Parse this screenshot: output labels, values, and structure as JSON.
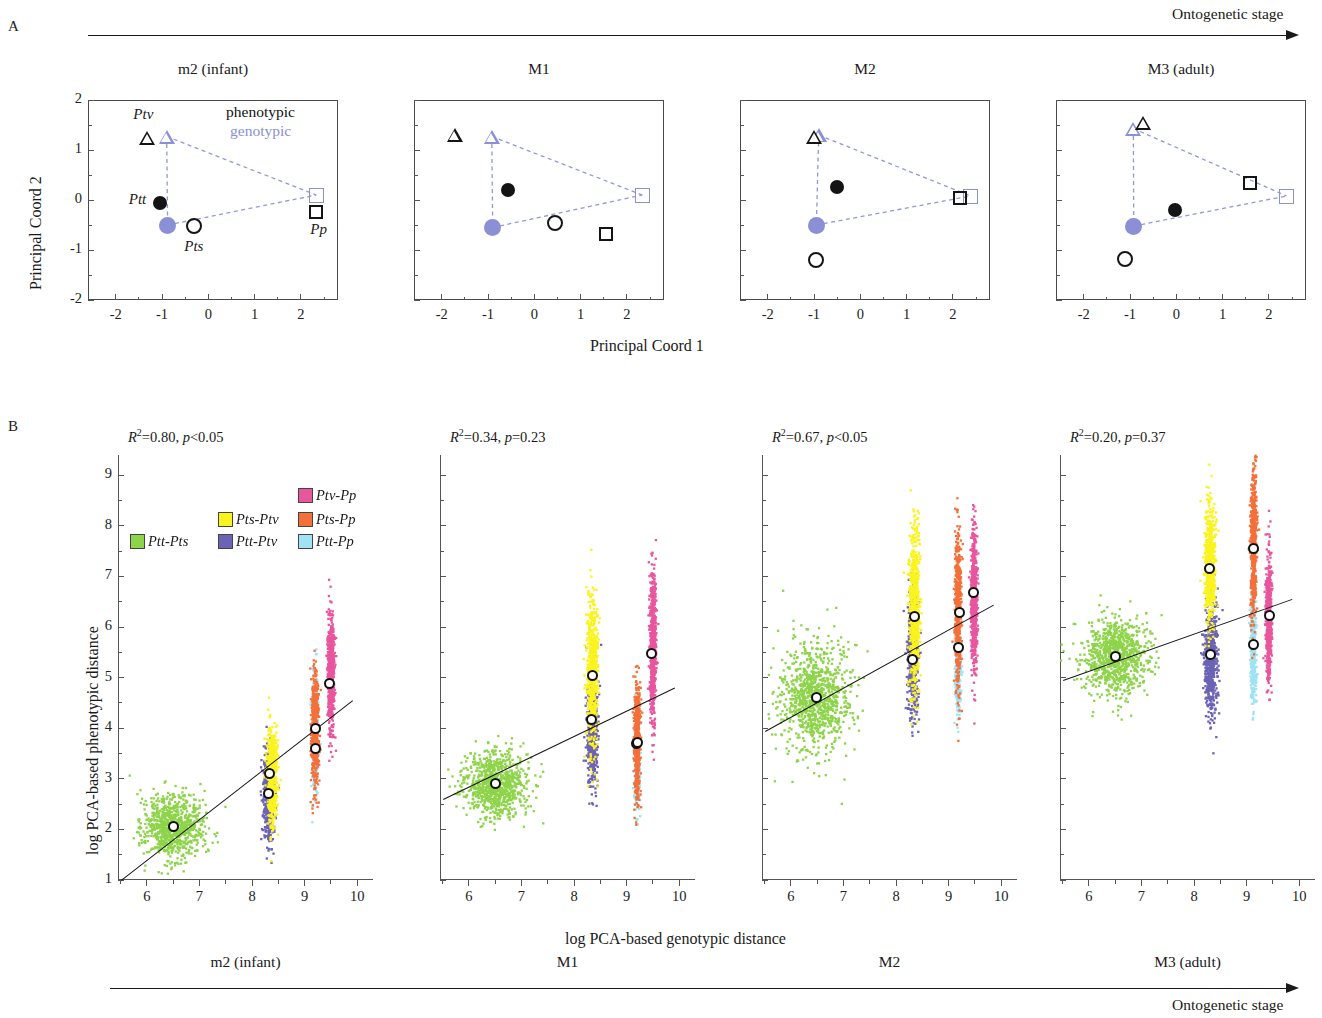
{
  "figure": {
    "panel_a_letter": "A",
    "panel_b_letter": "B",
    "top_arrow_label": "Ontogenetic stage",
    "bottom_arrow_label": "Ontogenetic stage"
  },
  "stages": [
    "m2 (infant)",
    "M1",
    "M2",
    "M3 (adult)"
  ],
  "panelA": {
    "xlabel": "Principal Coord 1",
    "ylabel": "Principal Coord 2",
    "xticks": [
      "-2",
      "-1",
      "0",
      "1",
      "2"
    ],
    "yticks": [
      "2",
      "1",
      "0",
      "-1",
      "-2"
    ],
    "xlim": [
      -2.6,
      2.8
    ],
    "ylim": [
      -2.0,
      2.0
    ],
    "legend": {
      "phenotypic": "phenotypic",
      "genotypic": "genotypic"
    },
    "colors": {
      "phenotypic": "#141414",
      "genotypic": "#8a8fd6"
    },
    "taxon_labels": [
      {
        "text": "Ptv",
        "panel": 0,
        "x": -1.62,
        "y": 1.68
      },
      {
        "text": "Ptt",
        "panel": 0,
        "x": -1.72,
        "y": -0.02
      },
      {
        "text": "Pts",
        "panel": 0,
        "x": -0.52,
        "y": -0.95
      },
      {
        "text": "Pp",
        "panel": 0,
        "x": 2.2,
        "y": -0.62
      }
    ],
    "panels": [
      {
        "stage": "m2 (infant)",
        "phenotypic": [
          {
            "taxon": "Ptv",
            "marker": "triangle",
            "x": -1.32,
            "y": 1.25
          },
          {
            "taxon": "Ptt",
            "marker": "circle-filled",
            "x": -1.05,
            "y": -0.05
          },
          {
            "taxon": "Pts",
            "marker": "circle-open",
            "x": -0.32,
            "y": -0.52
          },
          {
            "taxon": "Pp",
            "marker": "square-open",
            "x": 2.33,
            "y": -0.23
          }
        ],
        "genotypic": [
          {
            "taxon": "Ptv",
            "marker": "triangle",
            "x": -0.9,
            "y": 1.27
          },
          {
            "taxon": "Pts",
            "marker": "circle-filled",
            "x": -0.88,
            "y": -0.5
          },
          {
            "taxon": "Pp",
            "marker": "square-open",
            "x": 2.33,
            "y": 0.1
          }
        ]
      },
      {
        "stage": "M1",
        "phenotypic": [
          {
            "taxon": "Ptv",
            "marker": "triangle",
            "x": -1.72,
            "y": 1.3
          },
          {
            "taxon": "Ptt",
            "marker": "circle-filled",
            "x": -0.58,
            "y": 0.2
          },
          {
            "taxon": "Pts",
            "marker": "circle-open",
            "x": 0.45,
            "y": -0.45
          },
          {
            "taxon": "Pp",
            "marker": "square-open",
            "x": 1.55,
            "y": -0.68
          }
        ],
        "genotypic": [
          {
            "taxon": "Ptv",
            "marker": "triangle",
            "x": -0.92,
            "y": 1.27
          },
          {
            "taxon": "Pts",
            "marker": "circle-filled",
            "x": -0.9,
            "y": -0.55
          },
          {
            "taxon": "Pp",
            "marker": "square-open",
            "x": 2.33,
            "y": 0.1
          }
        ]
      },
      {
        "stage": "M2",
        "phenotypic": [
          {
            "taxon": "Ptv",
            "marker": "triangle",
            "x": -1.0,
            "y": 1.26
          },
          {
            "taxon": "Ptt",
            "marker": "circle-filled",
            "x": -0.5,
            "y": 0.27
          },
          {
            "taxon": "Pts",
            "marker": "circle-open",
            "x": -0.95,
            "y": -1.2
          },
          {
            "taxon": "Pp",
            "marker": "square-open",
            "x": 2.15,
            "y": 0.05
          }
        ],
        "genotypic": [
          {
            "taxon": "Ptv",
            "marker": "triangle",
            "x": -0.9,
            "y": 1.3
          },
          {
            "taxon": "Pts",
            "marker": "circle-filled",
            "x": -0.95,
            "y": -0.5
          },
          {
            "taxon": "Pp",
            "marker": "square-open",
            "x": 2.38,
            "y": 0.08
          }
        ]
      },
      {
        "stage": "M3 (adult)",
        "phenotypic": [
          {
            "taxon": "Ptv",
            "marker": "triangle",
            "x": -0.72,
            "y": 1.55
          },
          {
            "taxon": "Ptt",
            "marker": "circle-filled",
            "x": -0.03,
            "y": -0.2
          },
          {
            "taxon": "Pts",
            "marker": "circle-open",
            "x": -1.12,
            "y": -1.18
          },
          {
            "taxon": "Pp",
            "marker": "square-open",
            "x": 1.6,
            "y": 0.35
          }
        ],
        "genotypic": [
          {
            "taxon": "Ptv",
            "marker": "triangle",
            "x": -0.93,
            "y": 1.43
          },
          {
            "taxon": "Pts",
            "marker": "circle-filled",
            "x": -0.92,
            "y": -0.52
          },
          {
            "taxon": "Pp",
            "marker": "square-open",
            "x": 2.38,
            "y": 0.08
          }
        ]
      }
    ]
  },
  "panelB": {
    "xlabel": "log PCA-based genotypic distance",
    "ylabel": "log PCA-based phenotypic distance",
    "xticks": [
      "6",
      "7",
      "8",
      "9",
      "10"
    ],
    "yticks": [
      "9",
      "8",
      "7",
      "6",
      "5",
      "4",
      "3",
      "2",
      "1"
    ],
    "xlim": [
      5.45,
      10.3
    ],
    "ylim": [
      1.0,
      9.4
    ],
    "legend": [
      {
        "label": "Ptt-Pts",
        "color": "#8ed44a"
      },
      {
        "label": "Pts-Ptv",
        "color": "#fbf31f"
      },
      {
        "label": "Ptv-Pp",
        "color": "#e8569e"
      },
      {
        "label": "Ptt-Ptv",
        "color": "#6b63b5"
      },
      {
        "label": "Pts-Pp",
        "color": "#f4703a"
      },
      {
        "label": "Ptt-Pp",
        "color": "#9fe3f5"
      }
    ],
    "panels": [
      {
        "stage": "m2 (infant)",
        "stat_r2": "0.80",
        "stat_p": "p<0.05",
        "stat_text": "R2=0.80, p<0.05",
        "fit": {
          "x0": 5.5,
          "y0": 1.0,
          "x1": 9.9,
          "y1": 4.55
        },
        "clouds": [
          {
            "label": "Ptt-Pts",
            "color": "#8ed44a",
            "cx": 6.5,
            "cy": 2.05,
            "sx": 0.28,
            "sy": 0.32,
            "n": 900,
            "mean_x": 6.5,
            "mean_y": 2.05
          },
          {
            "label": "Ptt-Ptv",
            "color": "#6b63b5",
            "cx": 8.32,
            "cy": 2.7,
            "sx": 0.055,
            "sy": 0.45,
            "n": 500,
            "mean_x": 8.32,
            "mean_y": 2.7
          },
          {
            "label": "Pts-Ptv",
            "color": "#fbf31f",
            "cx": 8.38,
            "cy": 3.1,
            "sx": 0.05,
            "sy": 0.48,
            "n": 620,
            "mean_x": 8.34,
            "mean_y": 3.1
          },
          {
            "label": "Ptt-Pp",
            "color": "#9fe3f5",
            "cx": 9.2,
            "cy": 3.85,
            "sx": 0.035,
            "sy": 0.55,
            "n": 320,
            "mean_x": 9.2,
            "mean_y": 3.6
          },
          {
            "label": "Pts-Pp",
            "color": "#f4703a",
            "cx": 9.2,
            "cy": 3.95,
            "sx": 0.035,
            "sy": 0.6,
            "n": 520,
            "mean_x": 9.2,
            "mean_y": 4.0
          },
          {
            "label": "Ptv-Pp",
            "color": "#e8569e",
            "cx": 9.5,
            "cy": 5.1,
            "sx": 0.035,
            "sy": 0.55,
            "n": 620,
            "mean_x": 9.48,
            "mean_y": 4.88
          }
        ]
      },
      {
        "stage": "M1",
        "stat_r2": "0.34",
        "stat_p": "p=0.23",
        "stat_text": "R2=0.34, p=0.23",
        "fit": {
          "x0": 5.5,
          "y0": 2.6,
          "x1": 9.9,
          "y1": 4.8
        },
        "clouds": [
          {
            "label": "Ptt-Pts",
            "color": "#8ed44a",
            "cx": 6.5,
            "cy": 2.9,
            "sx": 0.3,
            "sy": 0.33,
            "n": 900,
            "mean_x": 6.5,
            "mean_y": 2.9
          },
          {
            "label": "Ptt-Ptv",
            "color": "#6b63b5",
            "cx": 8.35,
            "cy": 3.95,
            "sx": 0.05,
            "sy": 0.55,
            "n": 520,
            "mean_x": 8.33,
            "mean_y": 4.17
          },
          {
            "label": "Pts-Ptv",
            "color": "#fbf31f",
            "cx": 8.35,
            "cy": 5.1,
            "sx": 0.05,
            "sy": 0.75,
            "n": 680,
            "mean_x": 8.35,
            "mean_y": 5.05
          },
          {
            "label": "Ptt-Pp",
            "color": "#9fe3f5",
            "cx": 9.2,
            "cy": 3.3,
            "sx": 0.03,
            "sy": 0.5,
            "n": 260,
            "mean_x": 9.18,
            "mean_y": 3.7
          },
          {
            "label": "Pts-Pp",
            "color": "#f4703a",
            "cx": 9.2,
            "cy": 3.75,
            "sx": 0.03,
            "sy": 0.6,
            "n": 520,
            "mean_x": 9.2,
            "mean_y": 3.72
          },
          {
            "label": "Ptv-Pp",
            "color": "#e8569e",
            "cx": 9.5,
            "cy": 5.6,
            "sx": 0.03,
            "sy": 0.72,
            "n": 620,
            "mean_x": 9.48,
            "mean_y": 5.48
          }
        ]
      },
      {
        "stage": "M2",
        "stat_r2": "0.67",
        "stat_p": "p<0.05",
        "stat_text": "R2=0.67, p<0.05",
        "fit": {
          "x0": 5.5,
          "y0": 3.95,
          "x1": 9.85,
          "y1": 6.45
        },
        "clouds": [
          {
            "label": "Ptt-Pts",
            "color": "#8ed44a",
            "cx": 6.45,
            "cy": 4.6,
            "sx": 0.33,
            "sy": 0.55,
            "n": 1000,
            "mean_x": 6.48,
            "mean_y": 4.6
          },
          {
            "label": "Ptt-Ptv",
            "color": "#6b63b5",
            "cx": 8.32,
            "cy": 5.4,
            "sx": 0.05,
            "sy": 0.6,
            "n": 540,
            "mean_x": 8.32,
            "mean_y": 5.35
          },
          {
            "label": "Pts-Ptv",
            "color": "#fbf31f",
            "cx": 8.35,
            "cy": 6.35,
            "sx": 0.05,
            "sy": 0.78,
            "n": 700,
            "mean_x": 8.35,
            "mean_y": 6.2
          },
          {
            "label": "Ptt-Pp",
            "color": "#9fe3f5",
            "cx": 9.18,
            "cy": 5.1,
            "sx": 0.03,
            "sy": 0.4,
            "n": 240,
            "mean_x": 9.18,
            "mean_y": 5.6
          },
          {
            "label": "Pts-Pp",
            "color": "#f4703a",
            "cx": 9.18,
            "cy": 6.3,
            "sx": 0.03,
            "sy": 0.8,
            "n": 560,
            "mean_x": 9.2,
            "mean_y": 6.28
          },
          {
            "label": "Ptv-Pp",
            "color": "#e8569e",
            "cx": 9.48,
            "cy": 6.55,
            "sx": 0.03,
            "sy": 0.72,
            "n": 620,
            "mean_x": 9.48,
            "mean_y": 6.68
          }
        ]
      },
      {
        "stage": "M3 (adult)",
        "stat_r2": "0.20",
        "stat_p": "p=0.37",
        "stat_text": "R2=0.20, p=0.37",
        "fit": {
          "x0": 5.5,
          "y0": 4.95,
          "x1": 9.85,
          "y1": 6.55
        },
        "clouds": [
          {
            "label": "Ptt-Pts",
            "color": "#8ed44a",
            "cx": 6.5,
            "cy": 5.4,
            "sx": 0.3,
            "sy": 0.38,
            "n": 950,
            "mean_x": 6.5,
            "mean_y": 5.42
          },
          {
            "label": "Ptt-Ptv",
            "color": "#6b63b5",
            "cx": 8.32,
            "cy": 5.35,
            "sx": 0.06,
            "sy": 0.55,
            "n": 660,
            "mean_x": 8.32,
            "mean_y": 5.45
          },
          {
            "label": "Pts-Ptv",
            "color": "#fbf31f",
            "cx": 8.3,
            "cy": 7.2,
            "sx": 0.05,
            "sy": 0.6,
            "n": 600,
            "mean_x": 8.3,
            "mean_y": 7.15
          },
          {
            "label": "Ptt-Pp",
            "color": "#9fe3f5",
            "cx": 9.13,
            "cy": 5.5,
            "sx": 0.028,
            "sy": 0.55,
            "n": 380,
            "mean_x": 9.13,
            "mean_y": 5.65
          },
          {
            "label": "Pts-Pp",
            "color": "#f4703a",
            "cx": 9.13,
            "cy": 7.6,
            "sx": 0.028,
            "sy": 0.75,
            "n": 560,
            "mean_x": 9.13,
            "mean_y": 7.55
          },
          {
            "label": "Ptv-Pp",
            "color": "#e8569e",
            "cx": 9.42,
            "cy": 6.2,
            "sx": 0.028,
            "sy": 0.6,
            "n": 560,
            "mean_x": 9.44,
            "mean_y": 6.22
          }
        ]
      }
    ]
  },
  "chart_data": {
    "type": "scatter",
    "title": "",
    "panels_row_a": {
      "type": "scatter",
      "xlabel": "Principal Coord 1",
      "ylabel": "Principal Coord 2",
      "xlim": [
        -2.6,
        2.8
      ],
      "ylim": [
        -2,
        2
      ],
      "xticks": [
        -2,
        -1,
        0,
        1,
        2
      ],
      "yticks": [
        -2,
        -1,
        0,
        1,
        2
      ],
      "legend": [
        "phenotypic",
        "genotypic"
      ],
      "stages": [
        "m2 (infant)",
        "M1",
        "M2",
        "M3 (adult)"
      ],
      "taxa": [
        "Ptv",
        "Ptt",
        "Pts",
        "Pp"
      ]
    },
    "panels_row_b": {
      "type": "scatter",
      "xlabel": "log PCA-based genotypic distance",
      "ylabel": "log PCA-based phenotypic distance",
      "xlim": [
        5.45,
        10.3
      ],
      "ylim": [
        1,
        9.4
      ],
      "xticks": [
        6,
        7,
        8,
        9,
        10
      ],
      "yticks": [
        1,
        2,
        3,
        4,
        5,
        6,
        7,
        8,
        9
      ],
      "legend": [
        "Ptt-Pts",
        "Pts-Ptv",
        "Ptv-Pp",
        "Ptt-Ptv",
        "Pts-Pp",
        "Ptt-Pp"
      ],
      "stages": [
        "m2 (infant)",
        "M1",
        "M2",
        "M3 (adult)"
      ],
      "r_squared": [
        0.8,
        0.34,
        0.67,
        0.2
      ],
      "p_values": [
        "p<0.05",
        "p=0.23",
        "p<0.05",
        "p=0.37"
      ]
    }
  }
}
